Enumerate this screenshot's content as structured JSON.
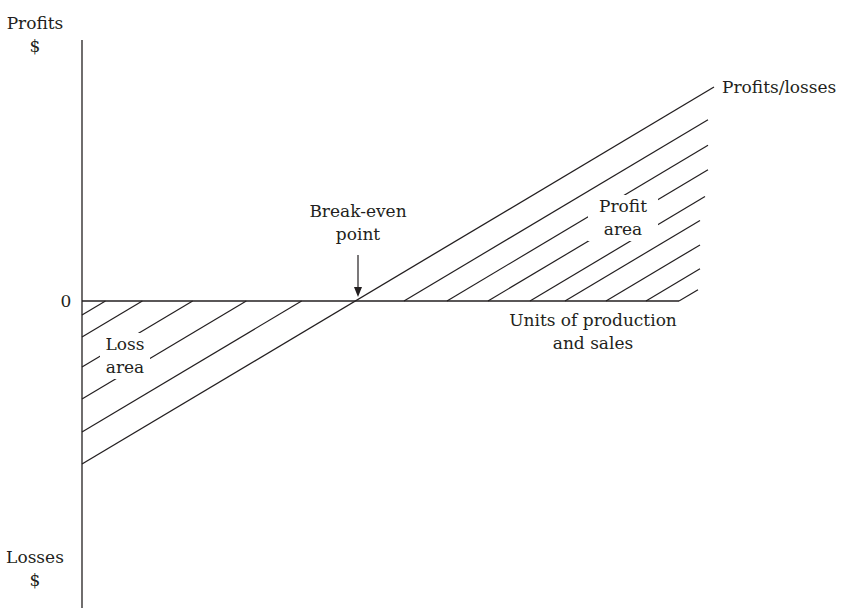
{
  "colors": {
    "ink": "#231f20",
    "background": "#ffffff"
  },
  "labels": {
    "y_top": [
      "Profits",
      "$"
    ],
    "y_bottom": [
      "Losses",
      "$"
    ],
    "zero": "0",
    "line": "Profits/losses",
    "break_even": [
      "Break-even",
      "point"
    ],
    "profit_area": [
      "Profit",
      "area"
    ],
    "loss_area": [
      "Loss",
      "area"
    ],
    "x_axis": [
      "Units of production",
      "and sales"
    ]
  },
  "chart_data": {
    "type": "line",
    "xlabel": "Units of production and sales",
    "ylabel_positive": "Profits $",
    "ylabel_negative": "Losses $",
    "y_ticks": [
      "0"
    ],
    "grid": false,
    "series": [
      {
        "name": "Profits/losses",
        "points": [
          [
            0,
            -1.0
          ],
          [
            1.0,
            0
          ],
          [
            2.94,
            1.16
          ]
        ],
        "note": "straight line from losses at zero units, crossing zero at the break-even point, rising into profit"
      }
    ],
    "annotations": [
      {
        "text": "Break-even point",
        "at": [
          1.0,
          0
        ],
        "type": "arrow"
      },
      {
        "text": "Loss area",
        "region": "between line and x-axis, left of break-even",
        "fill": "hatched"
      },
      {
        "text": "Profit area",
        "region": "between line and x-axis, right of break-even",
        "fill": "hatched"
      }
    ]
  },
  "geometry": {
    "y_axis": {
      "x": 82,
      "y1": 40,
      "y2": 608
    },
    "x_axis": {
      "x1": 82,
      "x2": 679,
      "y": 301
    },
    "main_line": {
      "x1": 82,
      "y1": 464,
      "x2": 714,
      "y2": 87
    },
    "loss_hatch_starts_y": [
      315,
      337,
      367,
      399,
      432
    ],
    "profit_hatch_starts_x": [
      404,
      447,
      488,
      530,
      565,
      606,
      646,
      679
    ],
    "profit_hatch_right_x": [
      708,
      708,
      708,
      705,
      700,
      700,
      700,
      698
    ],
    "arrow": {
      "x": 358,
      "y1": 255,
      "y2": 297
    }
  }
}
